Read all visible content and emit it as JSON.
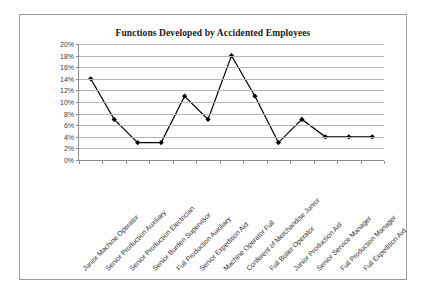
{
  "chart_data": {
    "type": "line",
    "title": "Functions Developed by Accidented Employees",
    "xlabel": "",
    "ylabel": "",
    "ylim": [
      0,
      20
    ],
    "ytick_labels": [
      "20%",
      "18%",
      "16%",
      "14%",
      "12%",
      "10%",
      "8%",
      "6%",
      "4%",
      "2%",
      "0%"
    ],
    "ytick_values": [
      20,
      18,
      16,
      14,
      12,
      10,
      8,
      6,
      4,
      2,
      0
    ],
    "grid": true,
    "legend": false,
    "legend_position": "none",
    "marker": "diamond",
    "series_color": "#000000",
    "categories": [
      "Junior Machine Operator",
      "Senior Production Auxiliary",
      "Senior Production Electrician",
      "Senior Burden Supervisor",
      "Full Production Auxiliary",
      "Senior Expedition Aid",
      "Machine Operator Full",
      "Conferent of Merchandise Junior",
      "Full Boiler Operator",
      "Junior Production Aid",
      "Senior Service Manager",
      "Full Production Manager",
      "Full Expedition Aid"
    ],
    "values": [
      14,
      7,
      3,
      3,
      11,
      7,
      18,
      11,
      3,
      7,
      4,
      4,
      4
    ]
  }
}
